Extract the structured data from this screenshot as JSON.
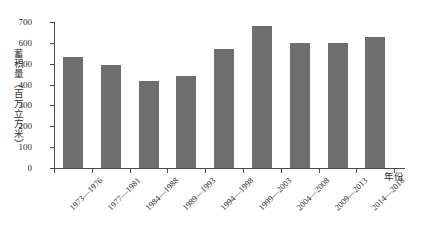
{
  "chart_data": {
    "type": "bar",
    "title": "",
    "xlabel": "年份",
    "ylabel": "蓄积量（百万立方米）",
    "categories": [
      "1973—1976",
      "1977—1981",
      "1984—1988",
      "1989—1993",
      "1994—1998",
      "1999—2003",
      "2004—2008",
      "2009—2013",
      "2014—2018"
    ],
    "values": [
      530,
      495,
      415,
      440,
      570,
      680,
      600,
      597,
      628
    ],
    "ylim": [
      0,
      700
    ],
    "ytick_labels": [
      "700",
      "600",
      "500",
      "400",
      "300",
      "200",
      "100",
      "0"
    ],
    "ytick_values": [
      700,
      600,
      500,
      400,
      300,
      200,
      100,
      0
    ],
    "grid": false,
    "legend": "none",
    "series_color": "#6e6e6e",
    "axis_color": "#4a4a4a"
  }
}
